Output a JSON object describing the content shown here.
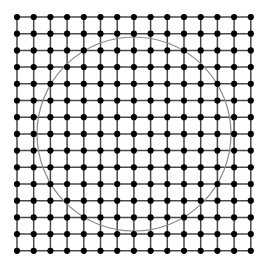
{
  "figure": {
    "width": 268,
    "height": 269,
    "background_color": "#ffffff"
  },
  "chart_data": {
    "type": "scatter",
    "subtitle": "",
    "xlabel": "",
    "ylabel": "",
    "grid": true,
    "legend_position": "none",
    "xlim": [
      0,
      14
    ],
    "ylim": [
      0,
      14
    ],
    "xticks": [
      0,
      1,
      2,
      3,
      4,
      5,
      6,
      7,
      8,
      9,
      10,
      11,
      12,
      13,
      14
    ],
    "yticks": [
      0,
      1,
      2,
      3,
      4,
      5,
      6,
      7,
      8,
      9,
      10,
      11,
      12,
      13,
      14
    ],
    "xtick_labels": [],
    "ytick_labels": [],
    "annotations": [],
    "series": [
      {
        "name": "lattice-points",
        "type": "scatter",
        "marker": "circle",
        "marker_color": "#000000",
        "marker_radius_px": 3.1,
        "columns": 15,
        "rows": 15,
        "point_count": 225,
        "x_values": [
          0,
          1,
          2,
          3,
          4,
          5,
          6,
          7,
          8,
          9,
          10,
          11,
          12,
          13,
          14
        ],
        "y_values": [
          0,
          1,
          2,
          3,
          4,
          5,
          6,
          7,
          8,
          9,
          10,
          11,
          12,
          13,
          14
        ]
      },
      {
        "name": "grid-lines",
        "type": "line",
        "color": "#4a4a4a",
        "stroke_width_px": 1.5,
        "vertical_count": 15,
        "horizontal_count": 15
      },
      {
        "name": "inscribed-circle",
        "type": "line",
        "color": "#8a8a8a",
        "stroke_width_px": 1.2,
        "center_x": 7,
        "center_y": 7,
        "radius": 5.85,
        "center_px": [
          134,
          134
        ],
        "radius_px": 97
      }
    ]
  },
  "geometry": {
    "origin_px": {
      "x": 17,
      "y": 17
    },
    "spacing_px": 16.7,
    "cells_per_side": 14,
    "dots_per_side": 15,
    "grid_color": "#4a4a4a",
    "dot_color": "#000000",
    "circle_color": "#8a8a8a",
    "circle_center_px": {
      "x": 134,
      "y": 134
    },
    "circle_radius_px": 97,
    "grid_stroke_width": 1.5,
    "circle_stroke_width": 1.2,
    "dot_radius": 3.1
  }
}
